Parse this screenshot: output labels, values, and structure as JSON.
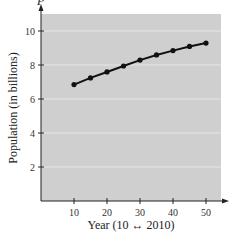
{
  "chart_data": {
    "type": "line",
    "title": "",
    "xlabel": "Year (10 ↔ 2010)",
    "ylabel": "Population (in billions)",
    "y_axis_variable": "P",
    "x": [
      10,
      15,
      20,
      25,
      30,
      35,
      40,
      45,
      50
    ],
    "series": [
      {
        "name": "P",
        "values": [
          6.85,
          7.24,
          7.59,
          7.94,
          8.29,
          8.59,
          8.85,
          9.09,
          9.29
        ]
      }
    ],
    "xticks": [
      10,
      20,
      30,
      40,
      50
    ],
    "yticks": [
      2,
      4,
      6,
      8,
      10
    ],
    "xlim": [
      0,
      56
    ],
    "ylim": [
      0,
      11
    ],
    "grid": "horizontal",
    "legend": "none",
    "colors": {
      "plot_bg": "#cfcfcf",
      "grid": "#e6e6e6",
      "line": "#111111",
      "axis": "#222222"
    }
  }
}
